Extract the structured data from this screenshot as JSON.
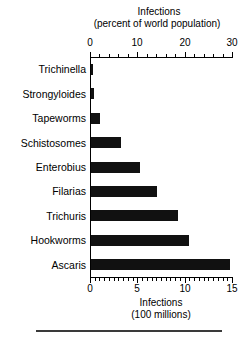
{
  "chart_data": {
    "type": "bar",
    "orientation": "horizontal",
    "title": "",
    "categories": [
      "Trichinella",
      "Strongyloides",
      "Tapeworms",
      "Schistosomes",
      "Enterobius",
      "Filarias",
      "Trichuris",
      "Hookworms",
      "Ascaris"
    ],
    "values": [
      0.25,
      0.3,
      1.0,
      3.2,
      5.2,
      7.0,
      9.2,
      10.3,
      14.7
    ],
    "value_unit": "hundred millions of infections",
    "top_axis": {
      "label_line1": "Infections",
      "label_line2": "(percent of world population)",
      "ticks": [
        0,
        10,
        20,
        30
      ],
      "tick_labels": [
        "0",
        "10",
        "20",
        "30"
      ],
      "minor_tick_step": 2,
      "range": [
        0,
        30
      ]
    },
    "bottom_axis": {
      "label_line1": "Infections",
      "label_line2": "(100 millions)",
      "ticks": [
        0,
        5,
        10,
        15
      ],
      "tick_labels": [
        "0",
        "5",
        "10",
        "15"
      ],
      "minor_tick_step": 0.5,
      "range": [
        0,
        15
      ]
    },
    "xlabel": "Infections (100 millions)",
    "ylabel": "",
    "grid": false,
    "legend": null,
    "bar_color": "#111111"
  }
}
